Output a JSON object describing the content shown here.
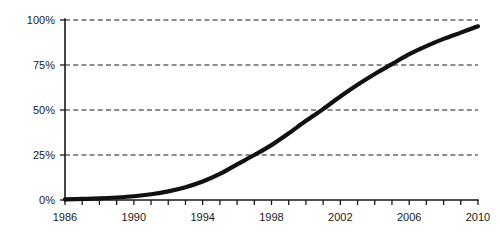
{
  "chart_data": {
    "type": "line",
    "title": "",
    "subtitle": "",
    "xlabel": "",
    "ylabel": "",
    "xlim": [
      1986,
      2010
    ],
    "ylim": [
      0,
      100
    ],
    "grid": true,
    "grid_axis": "y",
    "grid_style": "dashed",
    "legend": false,
    "legend_position": "none",
    "y_tick_labels": [
      "0%",
      "25%",
      "50%",
      "75%",
      "100%"
    ],
    "y_tick_values": [
      0,
      25,
      50,
      75,
      100
    ],
    "x_tick_labels": [
      "1986",
      "1990",
      "1994",
      "1998",
      "2002",
      "2006",
      "2010"
    ],
    "x_tick_values": [
      1986,
      1990,
      1994,
      1998,
      2002,
      2006,
      2010
    ],
    "x_minor_tick_values": [
      1986,
      1987,
      1988,
      1989,
      1990,
      1991,
      1992,
      1993,
      1994,
      1995,
      1996,
      1997,
      1998,
      1999,
      2000,
      2001,
      2002,
      2003,
      2004,
      2005,
      2006,
      2007,
      2008,
      2009,
      2010
    ],
    "series": [
      {
        "name": "",
        "color": "#111111",
        "x": [
          1986,
          1987,
          1988,
          1989,
          1990,
          1991,
          1992,
          1993,
          1994,
          1995,
          1996,
          1997,
          1998,
          1999,
          2000,
          2001,
          2002,
          2003,
          2004,
          2005,
          2006,
          2007,
          2008,
          2009,
          2010
        ],
        "values": [
          0.4,
          0.6,
          0.9,
          1.4,
          2.1,
          3.2,
          4.8,
          7.1,
          10.3,
          14.5,
          19.8,
          25.0,
          30.5,
          37.0,
          44.0,
          50.5,
          57.5,
          64.0,
          70.0,
          75.5,
          81.0,
          85.5,
          89.5,
          93.0,
          96.5
        ]
      }
    ],
    "annotations": []
  },
  "axis": {
    "y_labels": [
      "100%",
      "75%",
      "50%",
      "25%",
      "0%"
    ],
    "x_labels": [
      "1986",
      "1990",
      "1994",
      "1998",
      "2002",
      "2006",
      "2010"
    ]
  },
  "colors": {
    "line": "#111111",
    "axis": "#1a1a1a",
    "grid": "#1a1a1a",
    "background": "#ffffff",
    "text": "#1a1a1a"
  }
}
